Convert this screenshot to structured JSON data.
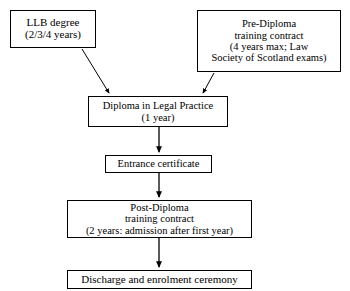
{
  "diagram": {
    "ink_color": "#000000",
    "background_color": "#ffffff",
    "nodes": [
      {
        "id": "llb",
        "name": "llb-degree",
        "lines": [
          "LLB degree",
          "(2/3/4 years)"
        ]
      },
      {
        "id": "predip",
        "name": "pre-diploma-training-contract",
        "lines": [
          "Pre-Diploma",
          "training contract",
          "(4 years max; Law",
          "Society of Scotland exams)"
        ]
      },
      {
        "id": "diploma",
        "name": "diploma-in-legal-practice",
        "lines": [
          "Diploma in Legal Practice",
          "(1 year)"
        ]
      },
      {
        "id": "entrance",
        "name": "entrance-certificate",
        "lines": [
          "Entrance certificate"
        ]
      },
      {
        "id": "postdip",
        "name": "post-diploma-training-contract",
        "lines": [
          "Post-Diploma",
          "training contract",
          "(2 years: admission after first year)"
        ]
      },
      {
        "id": "discharge",
        "name": "discharge-and-enrolment-ceremony",
        "lines": [
          "Discharge and enrolment ceremony"
        ]
      }
    ],
    "edges": [
      {
        "id": "llb-to-diploma",
        "from": "llb",
        "to": "diploma",
        "style": "diagonal-arrow"
      },
      {
        "id": "predip-to-diploma",
        "from": "predip",
        "to": "diploma",
        "style": "diagonal-arrow"
      },
      {
        "id": "diploma-to-entrance",
        "from": "diploma",
        "to": "entrance",
        "style": "vertical-arrow"
      },
      {
        "id": "entrance-to-postdip",
        "from": "entrance",
        "to": "postdip",
        "style": "vertical-arrow"
      },
      {
        "id": "postdip-to-discharge",
        "from": "postdip",
        "to": "discharge",
        "style": "vertical-arrow"
      }
    ]
  }
}
